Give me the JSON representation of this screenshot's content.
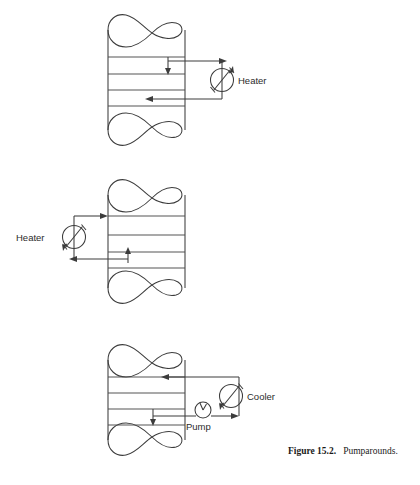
{
  "figure": {
    "label": "Figure 15.2.",
    "title": "Pumparounds.",
    "caption_full": "Figure 15.2. Pumparounds."
  },
  "style": {
    "line_color": "#3c3c3c",
    "text_color": "#1a1a1a",
    "background": "#ffffff"
  },
  "diagrams": [
    {
      "id": "pumparound-top",
      "description": "Column with external heater on the right side; liquid drawn from upper tray, heated, returned to lower tray",
      "equipment_label": "Heater",
      "equipment_type": "heater",
      "equipment_side": "right",
      "tray_count": 4,
      "draw_off": "upper tray",
      "return": "lower tray",
      "has_pump": false
    },
    {
      "id": "pumparound-middle",
      "description": "Column with external heater on the left side; liquid drawn from lower tray, heated, returned to upper tray",
      "equipment_label": "Heater",
      "equipment_type": "heater",
      "equipment_side": "left",
      "tray_count": 4,
      "draw_off": "lower tray",
      "return": "upper tray",
      "has_pump": false
    },
    {
      "id": "pumparound-bottom",
      "description": "Column with external pump and cooler on the right side; liquid drawn from lower tray, pumped through cooler, returned to upper tray",
      "equipment_label": "Cooler",
      "equipment_type": "cooler",
      "equipment_side": "right",
      "pump_label": "Pump",
      "tray_count": 4,
      "draw_off": "lower tray",
      "return": "upper tray",
      "has_pump": true
    }
  ],
  "labels": {
    "heater_top": "Heater",
    "heater_middle": "Heater",
    "cooler_bottom": "Cooler",
    "pump_bottom": "Pump"
  }
}
